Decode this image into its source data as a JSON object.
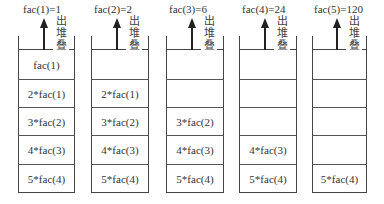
{
  "diagram": {
    "pop_label": "出堆叠",
    "pop_chars": [
      "出",
      "堆",
      "叠"
    ],
    "stacks": [
      {
        "result_label": "fac(1)=1",
        "cells": [
          "fac(1)",
          "2*fac(1)",
          "3*fac(2)",
          "4*fac(3)",
          "5*fac(4)"
        ]
      },
      {
        "result_label": "fac(2)=2",
        "cells": [
          "",
          "2*fac(1)",
          "3*fac(2)",
          "4*fac(3)",
          "5*fac(4)"
        ]
      },
      {
        "result_label": "fac(3)=6",
        "cells": [
          "",
          "",
          "3*fac(2)",
          "4*fac(3)",
          "5*fac(4)"
        ]
      },
      {
        "result_label": "fac(4)=24",
        "cells": [
          "",
          "",
          "",
          "4*fac(3)",
          "5*fac(4)"
        ]
      },
      {
        "result_label": "fac(5)=120",
        "cells": [
          "",
          "",
          "",
          "",
          "5*fac(4)"
        ]
      }
    ]
  }
}
